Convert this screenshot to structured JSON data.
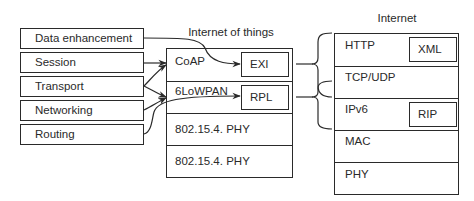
{
  "functions": [
    {
      "label": "Data enhancement"
    },
    {
      "label": "Session"
    },
    {
      "label": "Transport"
    },
    {
      "label": "Networking"
    },
    {
      "label": "Routing"
    }
  ],
  "iot_stack": {
    "title": "Internet of things",
    "layers": [
      {
        "label": "CoAP",
        "inner": "EXI"
      },
      {
        "label": "6LoWPAN",
        "inner": "RPL"
      },
      {
        "label": "802.15.4. PHY"
      },
      {
        "label": "802.15.4. PHY"
      }
    ]
  },
  "internet_stack": {
    "title": "Internet",
    "layers": [
      {
        "label": "HTTP",
        "inner": "XML"
      },
      {
        "label": "TCP/UDP"
      },
      {
        "label": "IPv6",
        "inner": "RIP"
      },
      {
        "label": "MAC"
      },
      {
        "label": "PHY"
      }
    ]
  },
  "colors": {
    "stroke": "#2a2a2a",
    "background": "#ffffff"
  }
}
